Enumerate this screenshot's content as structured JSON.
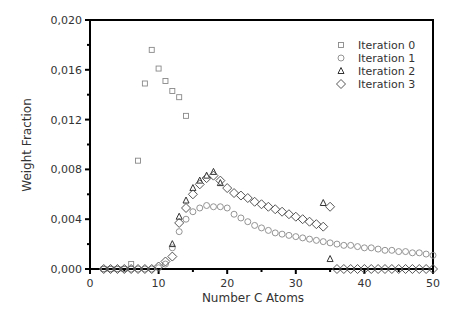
{
  "chart_data": {
    "type": "scatter",
    "title": "",
    "xlabel": "Number C Atoms",
    "ylabel": "Weight Fraction",
    "xlim": [
      0,
      50
    ],
    "ylim": [
      0,
      0.02
    ],
    "x_ticks": [
      0,
      10,
      20,
      30,
      40,
      50
    ],
    "x_tick_labels": [
      "0",
      "10",
      "20",
      "30",
      "40",
      "50"
    ],
    "y_ticks": [
      0,
      0.004,
      0.008,
      0.012,
      0.016,
      0.02
    ],
    "y_tick_labels": [
      "0,000",
      "0,004",
      "0,008",
      "0,012",
      "0,016",
      "0,020"
    ],
    "grid": false,
    "legend_position": "upper right",
    "series": [
      {
        "name": "Iteration 0",
        "marker": "square",
        "color": "#888888",
        "x": [
          2,
          3,
          4,
          5,
          6,
          7,
          8,
          9,
          10,
          11,
          12,
          13,
          14
        ],
        "y": [
          0.0,
          0.0,
          0.0,
          0.0,
          0.0004,
          0.0087,
          0.0149,
          0.0176,
          0.0161,
          0.0151,
          0.0143,
          0.0138,
          0.0123
        ]
      },
      {
        "name": "Iteration 1",
        "marker": "circle",
        "color": "#888888",
        "x": [
          2,
          3,
          4,
          5,
          6,
          7,
          8,
          9,
          10,
          11,
          12,
          13,
          14,
          15,
          16,
          17,
          18,
          19,
          20,
          21,
          22,
          23,
          24,
          25,
          26,
          27,
          28,
          29,
          30,
          31,
          32,
          33,
          34,
          35,
          36,
          37,
          38,
          39,
          40,
          41,
          42,
          43,
          44,
          45,
          46,
          47,
          48,
          49,
          50
        ],
        "y": [
          0,
          0,
          0,
          0,
          0,
          0,
          0,
          0,
          0.0001,
          0.0004,
          0.0017,
          0.003,
          0.004,
          0.0046,
          0.0049,
          0.0051,
          0.005,
          0.005,
          0.0049,
          0.0044,
          0.0041,
          0.0038,
          0.0035,
          0.0033,
          0.0031,
          0.0029,
          0.0028,
          0.0027,
          0.0026,
          0.0025,
          0.0024,
          0.0023,
          0.0022,
          0.0021,
          0.002,
          0.0019,
          0.0019,
          0.0018,
          0.0017,
          0.0017,
          0.0016,
          0.0015,
          0.0015,
          0.0014,
          0.0014,
          0.0013,
          0.0013,
          0.0012,
          0.0011
        ]
      },
      {
        "name": "Iteration 2",
        "marker": "triangle",
        "color": "#333333",
        "x": [
          12,
          13,
          14,
          15,
          16,
          17,
          18,
          19,
          34,
          35
        ],
        "y": [
          0.002,
          0.0042,
          0.0055,
          0.0065,
          0.0071,
          0.0075,
          0.0078,
          0.0069,
          0.0053,
          0.0008
        ]
      },
      {
        "name": "Iteration 3",
        "marker": "diamond",
        "color": "#555555",
        "x": [
          2,
          3,
          4,
          5,
          6,
          7,
          8,
          9,
          10,
          11,
          12,
          13,
          14,
          15,
          16,
          17,
          18,
          19,
          20,
          21,
          22,
          23,
          24,
          25,
          26,
          27,
          28,
          29,
          30,
          31,
          32,
          33,
          34,
          35,
          36,
          37,
          38,
          39,
          40,
          41,
          42,
          43,
          44,
          45,
          46,
          47,
          48,
          49,
          50
        ],
        "y": [
          0,
          0,
          0,
          0,
          0,
          0,
          0,
          0,
          0.0002,
          0.0006,
          0.001,
          0.0037,
          0.0049,
          0.006,
          0.0068,
          0.0073,
          0.0075,
          0.0071,
          0.0065,
          0.0061,
          0.0059,
          0.0057,
          0.0054,
          0.0052,
          0.005,
          0.0048,
          0.0046,
          0.0044,
          0.0042,
          0.004,
          0.0038,
          0.0036,
          0.0034,
          0.005,
          0,
          0,
          0,
          0,
          0,
          0,
          0,
          0,
          0,
          0,
          0,
          0,
          0,
          0,
          0
        ]
      }
    ]
  }
}
